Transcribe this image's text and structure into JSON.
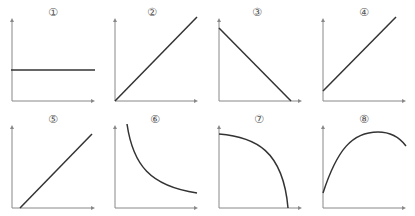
{
  "colors": {
    "axis": "#888888",
    "curve": "#333333",
    "label": "#555555",
    "background": "#ffffff"
  },
  "panels": [
    {
      "label": "①",
      "shape": "horizontal constant line",
      "axes": {
        "ox": 12,
        "oy": 101,
        "top": 18,
        "right": 95
      },
      "path": "M11,70 L95,70"
    },
    {
      "label": "②",
      "shape": "straight line through origin, increasing",
      "axes": {
        "ox": 115,
        "oy": 101,
        "top": 18,
        "right": 198
      },
      "path": "M115,101 L197,17"
    },
    {
      "label": "③",
      "shape": "straight line decreasing to x-axis",
      "axes": {
        "ox": 219,
        "oy": 101,
        "top": 18,
        "right": 302
      },
      "path": "M219,28 L291,101"
    },
    {
      "label": "④",
      "shape": "straight line increasing with positive intercept",
      "axes": {
        "ox": 323,
        "oy": 101,
        "top": 18,
        "right": 406
      },
      "path": "M323,91 L396,17"
    },
    {
      "label": "⑤",
      "shape": "straight line increasing with positive x-intercept",
      "axes": {
        "ox": 12,
        "oy": 208,
        "top": 125,
        "right": 95
      },
      "path": "M20,208 L92,134"
    },
    {
      "label": "⑥",
      "shape": "decreasing hyperbola-like curve",
      "axes": {
        "ox": 115,
        "oy": 208,
        "top": 125,
        "right": 198
      },
      "path": "M127,124 C133,165 150,186 197,193"
    },
    {
      "label": "⑦",
      "shape": "concave-down decreasing curve to x-axis",
      "axes": {
        "ox": 219,
        "oy": 208,
        "top": 125,
        "right": 302
      },
      "path": "M219,134 C255,137 283,150 288,208"
    },
    {
      "label": "⑧",
      "shape": "concave-down parabola-like rising then falling",
      "axes": {
        "ox": 323,
        "oy": 208,
        "top": 125,
        "right": 406
      },
      "path": "M323,193 C337,150 352,132 378,132 C392,132 400,138 406,146"
    }
  ],
  "label_positions": [
    {
      "x": 53,
      "y": 16
    },
    {
      "x": 152,
      "y": 16
    },
    {
      "x": 257,
      "y": 16
    },
    {
      "x": 364,
      "y": 16
    },
    {
      "x": 53,
      "y": 123
    },
    {
      "x": 155,
      "y": 123
    },
    {
      "x": 259,
      "y": 123
    },
    {
      "x": 364,
      "y": 123
    }
  ]
}
